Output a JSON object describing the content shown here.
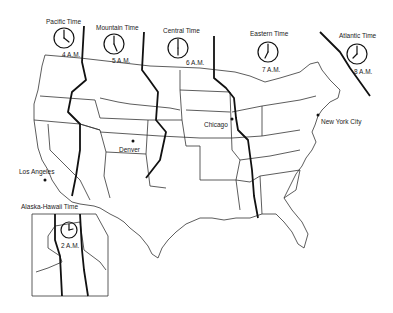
{
  "map": {
    "title": "U.S. Time Zones",
    "zones": [
      {
        "name": "Pacific Time",
        "time": "4 A.M.",
        "hour": 4
      },
      {
        "name": "Mountain Time",
        "time": "5 A.M.",
        "hour": 5
      },
      {
        "name": "Central Time",
        "time": "6 A.M.",
        "hour": 6
      },
      {
        "name": "Eastern Time",
        "time": "7 A.M.",
        "hour": 7
      },
      {
        "name": "Atlantic Time",
        "time": "8 A.M.",
        "hour": 8
      },
      {
        "name": "Alaska-Hawaii Time",
        "time": "2 A.M.",
        "hour": 2
      }
    ],
    "cities": [
      {
        "name": "Denver"
      },
      {
        "name": "Chicago"
      },
      {
        "name": "New York City"
      },
      {
        "name": "Los Angeles"
      }
    ],
    "colors": {
      "line": "#222222",
      "background": "#ffffff"
    }
  }
}
